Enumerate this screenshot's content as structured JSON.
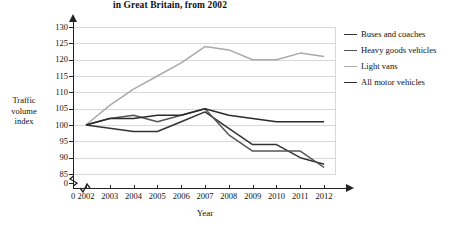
{
  "chart_data": {
    "type": "line",
    "title": "in Great Britain, from 2002",
    "xlabel": "Year",
    "ylabel": "Traffic volume index",
    "ylabel_lines": [
      "Traffic",
      "volume",
      "index"
    ],
    "categories": [
      "2002",
      "2003",
      "2004",
      "2005",
      "2006",
      "2007",
      "2008",
      "2009",
      "2010",
      "2011",
      "2012"
    ],
    "x_ticks": [
      "0",
      "2002",
      "2003",
      "2004",
      "2005",
      "2006",
      "2007",
      "2008",
      "2009",
      "2010",
      "2011",
      "2012"
    ],
    "y_ticks": [
      "130",
      "125",
      "120",
      "115",
      "110",
      "105",
      "100",
      "95",
      "90",
      "85",
      "0"
    ],
    "ylim": [
      85,
      130
    ],
    "y_axis_break": true,
    "x_axis_break": true,
    "grid": true,
    "legend_position": "right",
    "series": [
      {
        "name": "Buses and coaches",
        "color": "#333333",
        "values": [
          100,
          99,
          98,
          98,
          101,
          104,
          99,
          94,
          94,
          90,
          88
        ]
      },
      {
        "name": "Heavy goods vehicles",
        "color": "#555555",
        "values": [
          100,
          102,
          103,
          101,
          103,
          105,
          97,
          92,
          92,
          92,
          87
        ]
      },
      {
        "name": "Light vans",
        "color": "#aaaaaa",
        "values": [
          100,
          106,
          111,
          115,
          119,
          124,
          123,
          120,
          120,
          122,
          121
        ]
      },
      {
        "name": "All motor vehicles",
        "color": "#2b2b2b",
        "values": [
          100,
          102,
          102,
          103,
          103,
          105,
          103,
          102,
          101,
          101,
          101
        ]
      }
    ]
  }
}
